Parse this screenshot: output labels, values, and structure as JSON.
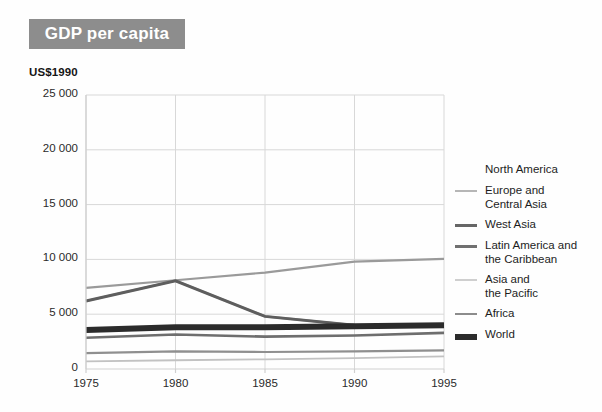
{
  "title": {
    "text": "GDP per capita",
    "banner_color": "#8d8d8d",
    "text_color": "#ffffff"
  },
  "unit_label": "US$1990",
  "chart_data": {
    "type": "line",
    "title": "GDP per capita",
    "subtitle": "",
    "xlabel": "",
    "ylabel": "US$1990",
    "x": [
      1975,
      1980,
      1985,
      1990,
      1995
    ],
    "xtick_labels": [
      "1975",
      "1980",
      "1985",
      "1990",
      "1995"
    ],
    "ytick_labels": [
      "0",
      "5 000",
      "10 000",
      "15 000",
      "20 000",
      "25 000"
    ],
    "yticks": [
      0,
      5000,
      10000,
      15000,
      20000,
      25000
    ],
    "xlim": [
      1975,
      1995
    ],
    "ylim": [
      0,
      25000
    ],
    "grid": true,
    "legend_position": "right",
    "series": [
      {
        "name": "North America",
        "values": [
          7400,
          8100,
          8800,
          9800,
          10050
        ],
        "color": "#9a9a9a",
        "width": 2.2,
        "legend_swatch": false
      },
      {
        "name": "Europe and\nCentral Asia",
        "values": [
          6200,
          8050,
          4800,
          4000,
          3950
        ],
        "color": "#adadad",
        "width": 2.2,
        "legend_swatch": true
      },
      {
        "name": "West Asia",
        "values": [
          6200,
          8050,
          4800,
          4000,
          3950
        ],
        "color": "#5e5e5e",
        "width": 3.0,
        "legend_swatch": true
      },
      {
        "name": "Latin America and\nthe Caribbean",
        "values": [
          2850,
          3150,
          2950,
          3050,
          3300
        ],
        "color": "#6e6e6e",
        "width": 2.6,
        "legend_swatch": true
      },
      {
        "name": "Asia and\nthe Pacific",
        "values": [
          700,
          800,
          880,
          1000,
          1150
        ],
        "color": "#c2c2c2",
        "width": 1.8,
        "legend_swatch": true
      },
      {
        "name": "Africa",
        "values": [
          1450,
          1600,
          1550,
          1600,
          1700
        ],
        "color": "#8f8f8f",
        "width": 2.2,
        "legend_swatch": true
      },
      {
        "name": "World",
        "values": [
          3550,
          3800,
          3800,
          3900,
          4000
        ],
        "color": "#2b2b2b",
        "width": 6.0,
        "legend_swatch": true
      }
    ]
  },
  "legend": [
    {
      "label": "North America",
      "swatch_color": "#ffffff",
      "has_swatch": false
    },
    {
      "label": "Europe and\nCentral Asia",
      "swatch_color": "#b6b6b6",
      "has_swatch": true
    },
    {
      "label": "West Asia",
      "swatch_color": "#666666",
      "has_swatch": true
    },
    {
      "label": "Latin America and\nthe Caribbean",
      "swatch_color": "#707070",
      "has_swatch": true
    },
    {
      "label": "Asia and\nthe Pacific",
      "swatch_color": "#cfcfcf",
      "has_swatch": true
    },
    {
      "label": "Africa",
      "swatch_color": "#8c8c8c",
      "has_swatch": true
    },
    {
      "label": "World",
      "swatch_color": "#2b2b2b",
      "has_swatch": true
    }
  ],
  "geometry": {
    "plot_left": 86,
    "plot_right": 444,
    "plot_top": 95,
    "plot_bottom": 369,
    "axis_color": "#cfcfcf",
    "grid_color": "#d8d8d8"
  }
}
